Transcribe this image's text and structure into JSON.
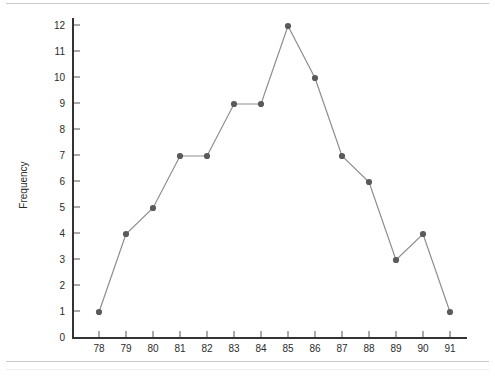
{
  "chart_data": {
    "type": "line",
    "title": "",
    "subtitle": "",
    "xlabel": "",
    "ylabel": "Frequency",
    "categories": [
      78,
      79,
      80,
      81,
      82,
      83,
      84,
      85,
      86,
      87,
      88,
      89,
      90,
      91
    ],
    "values": [
      1,
      4,
      5,
      7,
      7,
      9,
      9,
      12,
      10,
      7,
      6,
      3,
      4,
      1
    ],
    "x_tick_labels": [
      "78",
      "79",
      "80",
      "81",
      "82",
      "83",
      "84",
      "85",
      "86",
      "87",
      "88",
      "89",
      "90",
      "91"
    ],
    "y_tick_labels": [
      "0",
      "1",
      "2",
      "3",
      "4",
      "5",
      "6",
      "7",
      "8",
      "9",
      "10",
      "11",
      "12"
    ],
    "y_ticks": [
      0,
      1,
      2,
      3,
      4,
      5,
      6,
      7,
      8,
      9,
      10,
      11,
      12
    ],
    "xlim": [
      77.5,
      91.8
    ],
    "ylim": [
      0,
      12.4
    ],
    "grid": false,
    "legend": null,
    "legend_position": "none",
    "markers": true,
    "marker_shape": "circle",
    "series_color": "#5a5a5a",
    "line_color": "#8d8d8d",
    "axis_color": "#333333",
    "text_color": "#2b2b2b",
    "rule_color": "#c9c9c9",
    "background": "#ffffff"
  }
}
